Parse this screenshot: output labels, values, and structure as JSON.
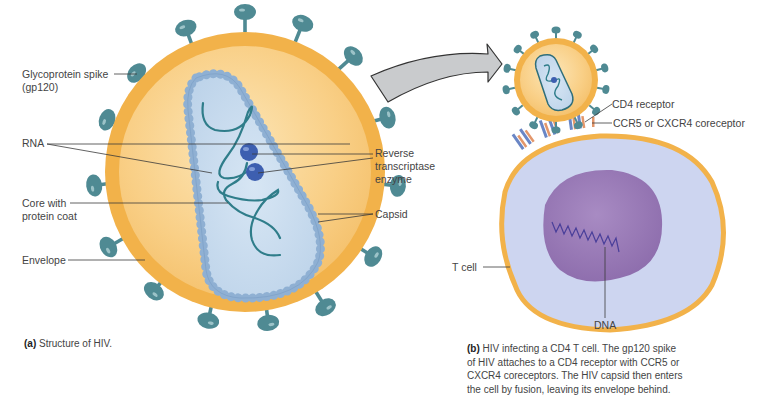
{
  "panel_a": {
    "labels": {
      "glycoprotein_spike_line1": "Glycoprotein spike",
      "glycoprotein_spike_line2": "(gp120)",
      "rna": "RNA",
      "core_line1": "Core with",
      "core_line2": "protein coat",
      "envelope": "Envelope",
      "reverse_transcriptase_line1": "Reverse",
      "reverse_transcriptase_line2": "transcriptase",
      "reverse_transcriptase_line3": "enzyme",
      "capsid": "Capsid"
    },
    "caption_letter": "(a)",
    "caption_text": " Structure of HIV."
  },
  "panel_b": {
    "labels": {
      "cd4_receptor": "CD4 receptor",
      "coreceptor": "CCR5 or CXCR4 coreceptor",
      "t_cell": "T cell",
      "dna": "DNA"
    },
    "caption_letter": "(b)",
    "caption_lines": [
      " HIV infecting a CD4 T cell. The gp120 spike",
      "of HIV attaches to a CD4 receptor with CCR5 or",
      "CXCR4 coreceptors. The HIV capsid then enters",
      "the cell by fusion, leaving its envelope behind."
    ]
  },
  "colors": {
    "envelope": "#f2b24a",
    "virus_interior": "#fbd99a",
    "core": "#c9dcef",
    "capsid_beads": "#8fb0d3",
    "rna": "#2f7d8a",
    "enzyme": "#3d5fb0",
    "spike": "#4f8a93",
    "t_cell_cytoplasm": "#cdd5f0",
    "nucleus": "#9b7cb8",
    "dna": "#4a3f9a",
    "arrow_fill": "#c9cbcd"
  }
}
